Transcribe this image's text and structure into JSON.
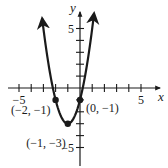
{
  "chart_data": {
    "type": "line",
    "title": "",
    "function": "y = 2(x + 1)^2 - 3",
    "xlabel": "x",
    "ylabel": "y",
    "xlim": [
      -6,
      6.5
    ],
    "ylim": [
      -5.5,
      6.3
    ],
    "grid": false,
    "legend": null,
    "x_ticks": [
      -5,
      -4,
      -3,
      -2,
      -1,
      1,
      2,
      3,
      4,
      5
    ],
    "y_ticks": [
      -5,
      -4,
      -3,
      -2,
      -1,
      1,
      2,
      3,
      4,
      5
    ],
    "x_tick_labels": [
      {
        "value": -5,
        "label": "−5"
      },
      {
        "value": 5,
        "label": "5"
      }
    ],
    "y_tick_labels": [
      {
        "value": 5,
        "label": "5"
      },
      {
        "value": -5,
        "label": "−5"
      }
    ],
    "series": [
      {
        "name": "parabola",
        "x": [
          -3.1,
          -3.0,
          -2.5,
          -2.0,
          -1.5,
          -1.0,
          -0.5,
          0.0,
          0.5,
          1.0,
          1.15
        ],
        "y": [
          5.82,
          5.0,
          1.5,
          -1.0,
          -2.5,
          -3.0,
          -2.5,
          -1.0,
          1.5,
          5.0,
          6.25
        ],
        "arrows_at_ends": true
      }
    ],
    "points": [
      {
        "x": -2,
        "y": -1,
        "label": "(−2, −1)"
      },
      {
        "x": 0,
        "y": -1,
        "label": "(0, −1)"
      },
      {
        "x": -1,
        "y": -3,
        "label": "(−1, −3)"
      }
    ]
  },
  "colors": {
    "curve": "#1a1a1a",
    "axes": "#1a1a1a",
    "background": "#ffffff"
  }
}
